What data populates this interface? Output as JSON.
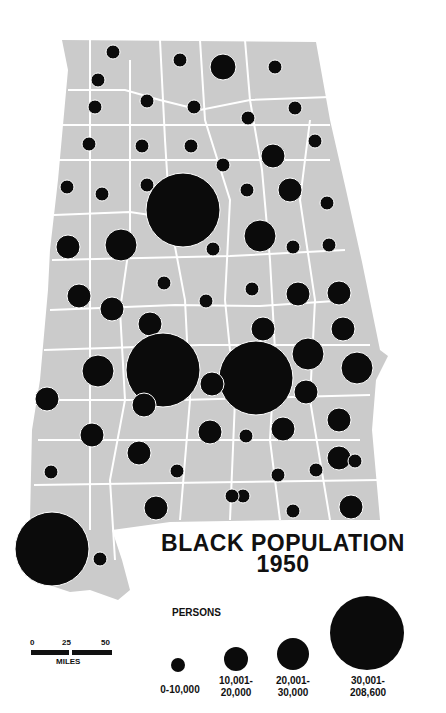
{
  "title": {
    "line1": "BLACK POPULATION",
    "line2": "1950"
  },
  "legend": {
    "heading": "PERSONS",
    "classes": [
      {
        "label_1": "0-10,000",
        "label_2": "",
        "cx": 178,
        "cy": 665,
        "r": 7
      },
      {
        "label_1": "10,001-",
        "label_2": "20,000",
        "cx": 236,
        "cy": 659,
        "r": 12
      },
      {
        "label_1": "20,001-",
        "label_2": "30,000",
        "cx": 293,
        "cy": 654,
        "r": 16
      },
      {
        "label_1": "30,001-",
        "label_2": "208,600",
        "cx": 367,
        "cy": 633,
        "r": 37
      }
    ]
  },
  "scale_bar": {
    "ticks": [
      "0",
      "25",
      "50"
    ],
    "unit": "MILES"
  },
  "colors": {
    "land": "#cbcbcb",
    "border": "#ffffff",
    "symbol": "#0b0b0b"
  },
  "circles": [
    [
      113,
      52,
      7
    ],
    [
      180,
      60,
      7
    ],
    [
      223,
      67,
      13
    ],
    [
      275,
      67,
      7
    ],
    [
      98,
      80,
      7
    ],
    [
      95,
      107,
      7
    ],
    [
      147,
      101,
      7
    ],
    [
      194,
      107,
      7
    ],
    [
      248,
      118,
      7
    ],
    [
      295,
      108,
      7
    ],
    [
      89,
      144,
      7
    ],
    [
      142,
      146,
      7
    ],
    [
      191,
      146,
      7
    ],
    [
      315,
      141,
      7
    ],
    [
      273,
      156,
      12
    ],
    [
      223,
      165,
      7
    ],
    [
      67,
      187,
      7
    ],
    [
      102,
      194,
      7
    ],
    [
      147,
      185,
      7
    ],
    [
      183,
      210,
      37
    ],
    [
      247,
      190,
      7
    ],
    [
      290,
      190,
      12
    ],
    [
      327,
      203,
      7
    ],
    [
      213,
      249,
      7
    ],
    [
      260,
      236,
      16
    ],
    [
      293,
      247,
      7
    ],
    [
      329,
      245,
      7
    ],
    [
      68,
      247,
      12
    ],
    [
      121,
      245,
      16
    ],
    [
      164,
      283,
      7
    ],
    [
      252,
      289,
      7
    ],
    [
      298,
      294,
      12
    ],
    [
      339,
      293,
      12
    ],
    [
      79,
      296,
      12
    ],
    [
      112,
      309,
      12
    ],
    [
      206,
      301,
      7
    ],
    [
      150,
      324,
      12
    ],
    [
      263,
      329,
      12
    ],
    [
      343,
      329,
      12
    ],
    [
      308,
      354,
      16
    ],
    [
      357,
      368,
      16
    ],
    [
      98,
      371,
      16
    ],
    [
      163,
      370,
      37
    ],
    [
      256,
      378,
      37
    ],
    [
      212,
      384,
      12
    ],
    [
      306,
      392,
      12
    ],
    [
      47,
      399,
      12
    ],
    [
      144,
      405,
      12
    ],
    [
      339,
      420,
      12
    ],
    [
      92,
      435,
      12
    ],
    [
      210,
      432,
      12
    ],
    [
      246,
      436,
      7
    ],
    [
      283,
      429,
      12
    ],
    [
      139,
      453,
      12
    ],
    [
      339,
      458,
      12
    ],
    [
      51,
      472,
      7
    ],
    [
      177,
      471,
      7
    ],
    [
      278,
      475,
      7
    ],
    [
      316,
      470,
      7
    ],
    [
      355,
      461,
      7
    ],
    [
      243,
      496,
      7
    ],
    [
      156,
      508,
      12
    ],
    [
      232,
      496,
      7
    ],
    [
      293,
      511,
      7
    ],
    [
      351,
      507,
      12
    ],
    [
      52,
      549,
      37
    ],
    [
      100,
      559,
      7
    ]
  ]
}
